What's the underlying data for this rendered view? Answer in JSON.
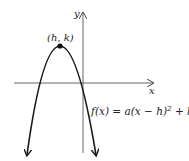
{
  "diagram": {
    "type": "parabola-graph",
    "axes": {
      "x_label": "x",
      "y_label": "y"
    },
    "vertex_label": "(h, k)",
    "equation": "f(x) = a(x − h)",
    "equation_exp": "2",
    "equation_tail": " + k",
    "colors": {
      "curve": "#1a1a1a",
      "axis": "#555555",
      "background": "#ffffff"
    }
  }
}
